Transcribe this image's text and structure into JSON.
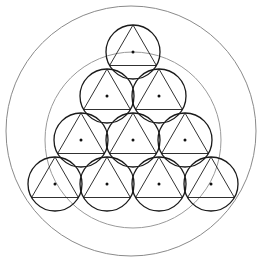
{
  "diagram": {
    "colors": {
      "background": "#ffffff",
      "stroke": "#1a1a1a",
      "guide": "#8a8a8a",
      "dot": "#111111"
    },
    "outer_circle": {
      "cx": 131,
      "cy": 131,
      "r": 125
    },
    "guide_circle": {
      "cx": 133,
      "cy": 140,
      "r": 88
    },
    "small_radius": 27,
    "rows": [
      [
        [
          133,
          52
        ]
      ],
      [
        [
          107,
          96
        ],
        [
          159,
          96
        ]
      ],
      [
        [
          81,
          140
        ],
        [
          133,
          140
        ],
        [
          185,
          140
        ]
      ],
      [
        [
          55,
          184
        ],
        [
          107,
          184
        ],
        [
          159,
          184
        ],
        [
          211,
          184
        ]
      ]
    ]
  }
}
